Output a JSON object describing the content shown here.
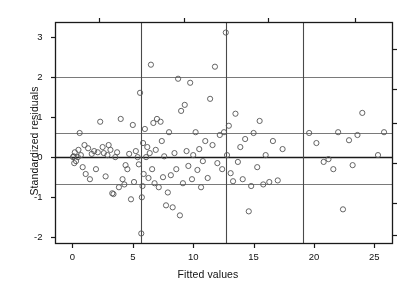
{
  "figure": {
    "background_color": "#ffffff",
    "frame_color": "#1a1a1a",
    "grid_color": "#7a7a7a",
    "point_color": "#555555"
  },
  "chart_data": {
    "type": "scatter",
    "title": "",
    "xlabel": "Fitted values",
    "ylabel": "Standardized residuals",
    "xlim": [
      -1.4,
      26.5
    ],
    "ylim": [
      -2.15,
      3.35
    ],
    "xticks": [
      0,
      5,
      10,
      15,
      20,
      25
    ],
    "yticks": [
      -2,
      -1,
      0,
      1,
      2,
      3
    ],
    "xtick_labels": [
      "0",
      "5",
      "10",
      "15",
      "20",
      "25"
    ],
    "ytick_labels": [
      "-2",
      "-1",
      "0",
      "1",
      "2",
      "3"
    ],
    "grid": false,
    "legend": "none",
    "marker": "open-circle",
    "marker_size": 4,
    "reference_lines": {
      "horizontal": [
        {
          "y": 2.0,
          "color": "#7a7a7a",
          "width": 1
        },
        {
          "y": 0.6,
          "color": "#7a7a7a",
          "width": 1
        },
        {
          "y": 0.0,
          "color": "#1a1a1a",
          "width": 1.4
        },
        {
          "y": -0.68,
          "color": "#7a7a7a",
          "width": 1
        }
      ],
      "vertical": [
        {
          "x": 5.7,
          "color": "#4a4a4a",
          "width": 1.1
        },
        {
          "x": 12.7,
          "color": "#4a4a4a",
          "width": 1.1
        },
        {
          "x": 19.1,
          "color": "#4a4a4a",
          "width": 1.1
        }
      ]
    },
    "x": [
      0.05,
      0.1,
      0.15,
      0.2,
      0.3,
      0.45,
      0.5,
      0.6,
      0.7,
      0.85,
      1.0,
      1.1,
      1.3,
      1.45,
      1.6,
      1.8,
      1.95,
      2.1,
      2.3,
      2.5,
      2.6,
      2.75,
      2.9,
      3.0,
      3.15,
      3.3,
      3.4,
      3.55,
      3.7,
      3.85,
      4.0,
      4.15,
      4.3,
      4.4,
      4.55,
      4.7,
      4.85,
      5.0,
      5.1,
      5.25,
      5.4,
      5.5,
      5.6,
      5.7,
      5.75,
      5.8,
      5.85,
      5.9,
      6.0,
      6.1,
      6.2,
      6.3,
      6.4,
      6.5,
      6.6,
      6.7,
      6.8,
      6.9,
      7.0,
      7.15,
      7.3,
      7.4,
      7.5,
      7.6,
      7.75,
      7.9,
      8.0,
      8.15,
      8.3,
      8.45,
      8.6,
      8.75,
      8.9,
      9.0,
      9.15,
      9.3,
      9.45,
      9.6,
      9.75,
      9.9,
      10.0,
      10.2,
      10.35,
      10.5,
      10.65,
      10.8,
      11.0,
      11.2,
      11.4,
      11.6,
      11.8,
      12.0,
      12.2,
      12.4,
      12.55,
      12.7,
      12.8,
      12.95,
      13.1,
      13.3,
      13.5,
      13.7,
      13.9,
      14.1,
      14.3,
      14.6,
      14.8,
      15.0,
      15.3,
      15.5,
      15.8,
      16.0,
      16.3,
      16.6,
      17.0,
      17.4,
      19.6,
      20.2,
      20.8,
      21.2,
      21.6,
      22.0,
      22.4,
      22.9,
      23.2,
      23.6,
      24.0,
      25.3,
      25.8
    ],
    "y": [
      0.0,
      0.02,
      -0.15,
      0.12,
      -0.1,
      0.0,
      0.18,
      0.6,
      0.05,
      -0.25,
      0.3,
      -0.42,
      0.22,
      -0.55,
      0.08,
      0.15,
      -0.3,
      0.12,
      0.88,
      0.25,
      0.1,
      -0.48,
      0.05,
      0.3,
      0.18,
      -0.9,
      -0.92,
      0.0,
      0.12,
      -0.75,
      0.95,
      -0.55,
      -0.68,
      -0.2,
      -0.3,
      0.08,
      -1.05,
      0.8,
      -0.62,
      0.15,
      0.0,
      -0.18,
      1.6,
      -1.9,
      -1.0,
      -0.72,
      0.35,
      -0.42,
      0.7,
      0.0,
      0.25,
      -0.52,
      0.1,
      2.3,
      -0.3,
      0.85,
      -0.65,
      0.18,
      0.95,
      -0.75,
      0.88,
      0.4,
      -0.5,
      0.02,
      -1.2,
      -0.88,
      0.62,
      -0.45,
      -1.25,
      0.1,
      -0.3,
      1.95,
      -1.45,
      1.15,
      -0.65,
      1.3,
      0.15,
      -0.22,
      1.85,
      -0.55,
      0.05,
      0.62,
      -0.32,
      0.2,
      -0.75,
      -0.1,
      0.4,
      -0.52,
      1.45,
      0.3,
      2.25,
      -0.15,
      0.55,
      -0.3,
      0.62,
      3.1,
      0.05,
      0.78,
      -0.4,
      -0.6,
      1.08,
      -0.12,
      0.25,
      -0.55,
      0.45,
      -1.35,
      -0.72,
      0.6,
      -0.25,
      0.9,
      -0.68,
      0.05,
      -0.62,
      0.4,
      -0.58,
      0.2,
      0.6,
      0.35,
      -0.12,
      -0.05,
      -0.3,
      0.62,
      -1.3,
      0.42,
      -0.2,
      0.55,
      1.1,
      0.05,
      0.62
    ]
  }
}
